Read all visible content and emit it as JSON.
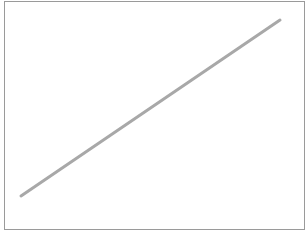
{
  "chart_data": {
    "type": "line",
    "title": "",
    "xlabel": "",
    "ylabel": "",
    "grid": false,
    "legend": null,
    "series": [
      {
        "name": "line",
        "color": "#a8a8a8",
        "points_px": [
          [
            21,
            196
          ],
          [
            280,
            20
          ]
        ],
        "x": [
          0,
          1
        ],
        "values": [
          0,
          1
        ]
      }
    ]
  },
  "style": {
    "line_color": "#a8a8a8",
    "line_width": 3,
    "frame_color": "#9a9a9a"
  }
}
